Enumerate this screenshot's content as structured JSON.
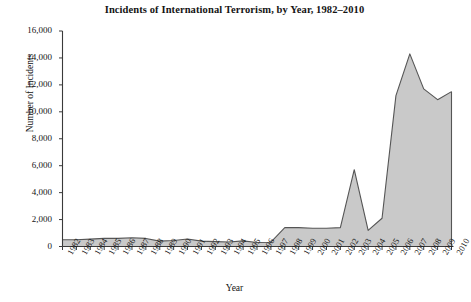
{
  "chart_data": {
    "type": "area",
    "title": "Incidents of International Terrorism, by Year, 1982–2010",
    "xlabel": "Year",
    "ylabel": "Number of Incidents",
    "ylim": [
      0,
      16000
    ],
    "ytick_labels": [
      "0",
      "2,000",
      "4,000",
      "6,000",
      "8,000",
      "10,000",
      "12,000",
      "14,000",
      "16,000"
    ],
    "ytick_values": [
      0,
      2000,
      4000,
      6000,
      8000,
      10000,
      12000,
      14000,
      16000
    ],
    "grid": false,
    "legend": "none",
    "fill_color": "#c9c9c9",
    "line_color": "#555555",
    "axis_color": "#3a3a3a",
    "categories": [
      "1982",
      "1983",
      "1984",
      "1985",
      "1986",
      "1987",
      "1988",
      "1989",
      "1990",
      "1991",
      "1992",
      "1993",
      "1994",
      "1995",
      "1996",
      "1997",
      "1998",
      "1999",
      "2000",
      "2001",
      "2002",
      "2003",
      "2004",
      "2005",
      "2006",
      "2007",
      "2008",
      "2009",
      "2010"
    ],
    "values": [
      500,
      500,
      550,
      600,
      600,
      650,
      600,
      400,
      450,
      560,
      400,
      360,
      330,
      420,
      300,
      320,
      1400,
      1400,
      1350,
      1350,
      1400,
      5700,
      1200,
      2100,
      11200,
      14300,
      11700,
      10900,
      11500
    ]
  }
}
